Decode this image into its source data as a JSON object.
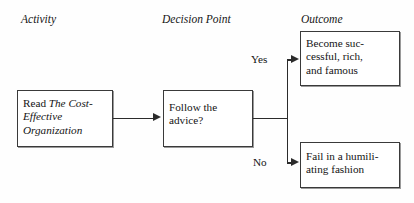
{
  "diagram": {
    "headers": [
      {
        "id": "activity",
        "label": "Activity"
      },
      {
        "id": "decision",
        "label": "Decision Point"
      },
      {
        "id": "outcome",
        "label": "Outcome"
      }
    ],
    "nodes": {
      "read": {
        "lead": "Read ",
        "title_italic": "The Cost-Effective Organization"
      },
      "decision": {
        "line1": "Follow the",
        "line2": "advice?"
      },
      "success": {
        "line1": "Become suc-",
        "line2": "cessful, rich,",
        "line3": "and famous"
      },
      "fail": {
        "line1": "Fail in a humili-",
        "line2": "ating fashion"
      }
    },
    "edge_labels": {
      "yes": "Yes",
      "no": "No"
    },
    "colors": {
      "box_border": "#3a3a3a",
      "connector": "#2b2b2b",
      "background": "#fefefe",
      "text": "#141414"
    }
  }
}
